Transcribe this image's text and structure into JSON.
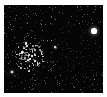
{
  "image": {
    "description": "Astronomical star field with a dense star cluster at left-center and a bright star at upper right",
    "background_color": "#050505",
    "border_color": "#ffffff",
    "bright_stars": [
      {
        "x": 90,
        "y": 26,
        "r": 2.6,
        "glow": 6
      },
      {
        "x": 8,
        "y": 67,
        "r": 1.4,
        "glow": 3
      },
      {
        "x": 51,
        "y": 42,
        "r": 1.2,
        "glow": 2.5
      },
      {
        "x": 24,
        "y": 55,
        "r": 1.2,
        "glow": 2.5
      },
      {
        "x": 28,
        "y": 51,
        "r": 1.0,
        "glow": 2
      },
      {
        "x": 18,
        "y": 48,
        "r": 1.0,
        "glow": 2
      },
      {
        "x": 22,
        "y": 38,
        "r": 0.9,
        "glow": 2
      },
      {
        "x": 31,
        "y": 56,
        "r": 0.9,
        "glow": 2
      }
    ],
    "cluster": {
      "cx": 25,
      "cy": 52,
      "spread": 14,
      "count": 90
    },
    "field_star_count": 380
  }
}
